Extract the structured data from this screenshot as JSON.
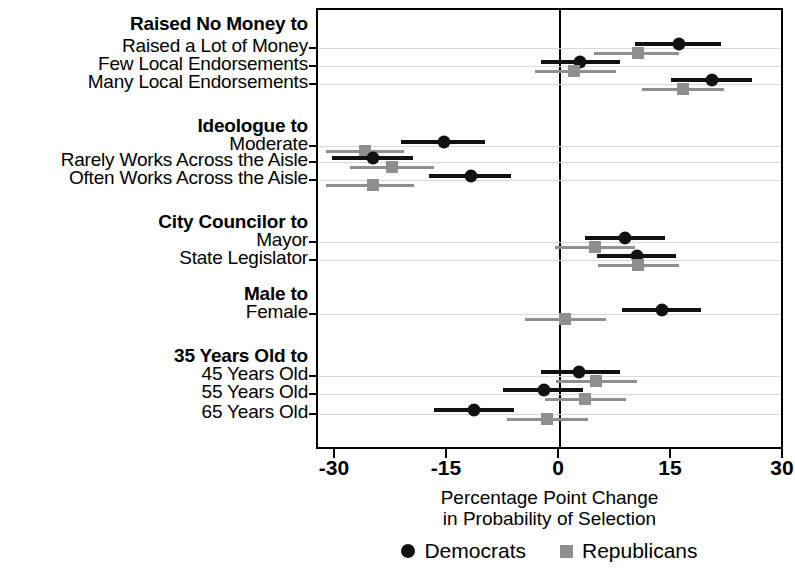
{
  "chart_data": {
    "type": "scatter",
    "title": "",
    "xlabel": "Percentage Point Change\nin Probability of Selection",
    "xlabel_line1": "Percentage Point Change",
    "xlabel_line2": "in Probability of Selection",
    "ylabel": "",
    "xlim": [
      -33,
      33
    ],
    "xticks": [
      -30,
      -15,
      0,
      15,
      30
    ],
    "xticklabels": [
      "-30",
      "-15",
      "0",
      "15",
      "30"
    ],
    "grid": true,
    "zero_reference_line": 0,
    "legend_position": "bottom",
    "legend": [
      {
        "name": "Democrats",
        "marker": "circle",
        "color": "#111111"
      },
      {
        "name": "Republicans",
        "marker": "square",
        "color": "#8f8f8f"
      }
    ],
    "groups": [
      {
        "header": "Raised No Money to",
        "rows": [
          {
            "label": "Raised a Lot of Money",
            "dem": {
              "estimate": 15.9,
              "ci_low": 10.0,
              "ci_high": 21.6
            },
            "rep": {
              "estimate": 10.4,
              "ci_low": 4.5,
              "ci_high": 16.0
            }
          },
          {
            "label": "Few Local Endorsements",
            "dem": {
              "estimate": 2.7,
              "ci_low": -2.6,
              "ci_high": 8.1
            },
            "rep": {
              "estimate": 1.9,
              "ci_low": -3.4,
              "ci_high": 7.5
            }
          },
          {
            "label": "Many Local Endorsements",
            "dem": {
              "estimate": 20.3,
              "ci_low": 14.8,
              "ci_high": 25.7
            },
            "rep": {
              "estimate": 16.5,
              "ci_low": 11.0,
              "ci_high": 22.0
            }
          }
        ]
      },
      {
        "header": "Ideologue to",
        "rows": [
          {
            "label": "Moderate",
            "dem": {
              "estimate": -15.5,
              "ci_low": -21.3,
              "ci_high": -10.0
            },
            "rep": {
              "estimate": -26.1,
              "ci_low": -31.3,
              "ci_high": -20.9
            }
          },
          {
            "label": "Rarely Works Across the Aisle",
            "dem": {
              "estimate": -25.1,
              "ci_low": -30.6,
              "ci_high": -19.7
            },
            "rep": {
              "estimate": -22.5,
              "ci_low": -28.1,
              "ci_high": -16.9
            }
          },
          {
            "label": "Often Works Across the Aisle",
            "dem": {
              "estimate": -11.9,
              "ci_low": -17.5,
              "ci_high": -6.6
            },
            "rep": {
              "estimate": -25.1,
              "ci_low": -31.3,
              "ci_high": -19.5
            }
          }
        ]
      },
      {
        "header": "City Councilor to",
        "rows": [
          {
            "label": "Mayor",
            "dem": {
              "estimate": 8.7,
              "ci_low": 3.4,
              "ci_high": 14.0
            },
            "rep": {
              "estimate": 4.7,
              "ci_low": -0.7,
              "ci_high": 10.1
            }
          },
          {
            "label": "State Legislator",
            "dem": {
              "estimate": 10.3,
              "ci_low": 5.0,
              "ci_high": 15.6
            },
            "rep": {
              "estimate": 10.5,
              "ci_low": 5.1,
              "ci_high": 16.0
            }
          }
        ]
      },
      {
        "header": "Male to",
        "rows": [
          {
            "label": "Female",
            "dem": {
              "estimate": 13.6,
              "ci_low": 8.3,
              "ci_high": 18.9
            },
            "rep": {
              "estimate": 0.7,
              "ci_low": -4.7,
              "ci_high": 6.1
            }
          }
        ]
      },
      {
        "header": "35 Years Old to",
        "rows": [
          {
            "label": "45 Years Old",
            "dem": {
              "estimate": 2.6,
              "ci_low": -2.6,
              "ci_high": 8.0
            },
            "rep": {
              "estimate": 4.8,
              "ci_low": -0.5,
              "ci_high": 10.3
            }
          },
          {
            "label": "55 Years Old",
            "dem": {
              "estimate": -2.2,
              "ci_low": -7.6,
              "ci_high": 3.1
            },
            "rep": {
              "estimate": 3.4,
              "ci_low": -2.0,
              "ci_high": 8.9
            }
          },
          {
            "label": "65 Years Old",
            "dem": {
              "estimate": -11.5,
              "ci_low": -16.9,
              "ci_high": -6.2
            },
            "rep": {
              "estimate": -1.7,
              "ci_low": -7.1,
              "ci_high": 3.7
            }
          }
        ]
      }
    ]
  }
}
